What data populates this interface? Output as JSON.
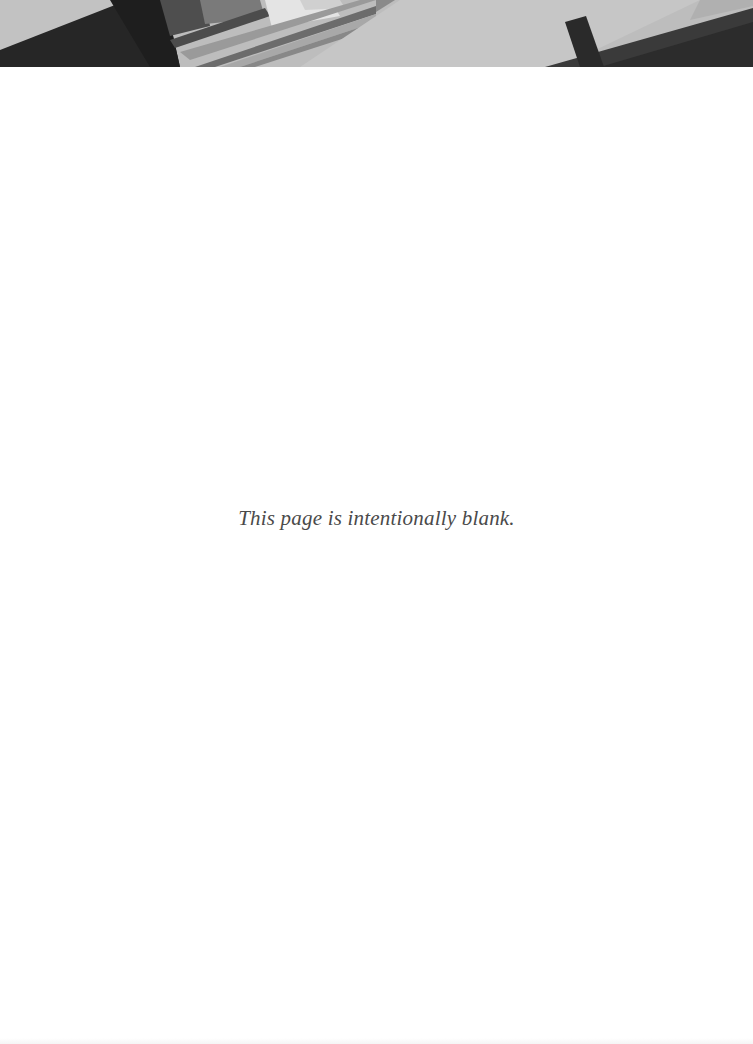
{
  "page": {
    "notice": "This page is intentionally blank."
  },
  "header_banner": {
    "description": "abstract grayscale diagonal geometric banner",
    "colors": {
      "light": "#c4c4c4",
      "mid": "#8e8e8e",
      "dark": "#2e2e2e",
      "highlight": "#e2e2e2"
    }
  }
}
